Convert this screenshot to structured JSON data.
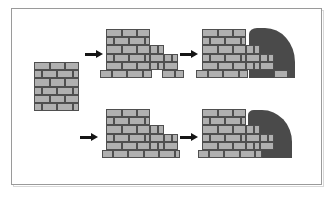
{
  "figure": {
    "background_color": "#ffffff",
    "frame_color": "#9a9a9a",
    "brick_fill_color": "#b0b0b0",
    "brick_outline_color": "#4f4f4f",
    "earth_fill_color": "#4a4a4a",
    "arrow_color": "#151515",
    "width": 335,
    "height": 198
  },
  "sequences": [
    {
      "id": "top-sequence",
      "label": "Top construction sequence",
      "steps": [
        {
          "id": "step-1-wall-panel",
          "label": "Plain brick wall panel"
        },
        {
          "id": "step-2-stepped-wall-pad-footing",
          "label": "Stepped wall on isolated pad footings"
        },
        {
          "id": "step-3-backfilled-wall-pad-footing",
          "label": "Stepped wall backfilled with earth"
        }
      ]
    },
    {
      "id": "bottom-sequence",
      "label": "Bottom construction sequence",
      "steps": [
        {
          "id": "step-1-stepped-wall-strip-footing",
          "label": "Stepped wall on continuous strip footing"
        },
        {
          "id": "step-2-backfilled-wall-strip-footing",
          "label": "Stepped wall backfilled with earth"
        }
      ]
    }
  ],
  "arrows": [
    {
      "id": "arrow-top-1",
      "label": "leads to"
    },
    {
      "id": "arrow-top-2",
      "label": "leads to"
    },
    {
      "id": "arrow-bottom-1",
      "label": "leads to"
    },
    {
      "id": "arrow-bottom-2",
      "label": "leads to"
    }
  ],
  "walls": {
    "panel": {
      "id": "brick-panel",
      "courses": 6,
      "bricks_per_course": 3,
      "bond": "running-bond"
    },
    "top_middle": {
      "id": "stepped-wall-pads",
      "footing_type": "isolated-pads",
      "steps": 3
    },
    "top_right": {
      "id": "stepped-wall-pads-backfilled",
      "footing_type": "isolated-pads",
      "steps": 3,
      "backfill": true
    },
    "bottom_middle": {
      "id": "stepped-wall-strip",
      "footing_type": "continuous-strip",
      "steps": 3
    },
    "bottom_right": {
      "id": "stepped-wall-strip-backfilled",
      "footing_type": "continuous-strip",
      "steps": 3,
      "backfill": true
    }
  }
}
